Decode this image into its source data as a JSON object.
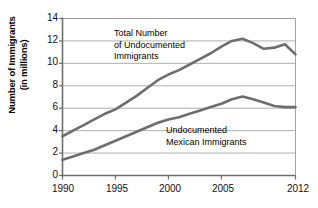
{
  "chart_data": {
    "type": "line",
    "title": "",
    "xlabel": "",
    "ylabel": "Number of Immigrants (in millions)",
    "ylabel_line1": "Number of Immigrants",
    "ylabel_line2": "(in millions)",
    "xlim": [
      1990,
      2012
    ],
    "ylim": [
      0,
      14
    ],
    "yticks": [
      "14",
      "12",
      "10",
      "8",
      "6",
      "4",
      "2",
      "0"
    ],
    "ytick_values": [
      14,
      12,
      10,
      8,
      6,
      4,
      2,
      0
    ],
    "xticks": [
      "1990",
      "1995",
      "2000",
      "2005",
      "2012"
    ],
    "xtick_values": [
      1990,
      1995,
      2000,
      2005,
      2012
    ],
    "grid": "horizontal",
    "legend": "annotations",
    "line_color": "#6e6e6e",
    "axis_color": "#808080",
    "grid_color": "#9a9a9a",
    "x": [
      1990,
      1991,
      1992,
      1993,
      1994,
      1995,
      1996,
      1997,
      1998,
      1999,
      2000,
      2001,
      2002,
      2003,
      2004,
      2005,
      2006,
      2007,
      2008,
      2009,
      2010,
      2011,
      2012
    ],
    "series": [
      {
        "name": "Total Number of Undocumented Immigrants",
        "annotation_lines": [
          "Total Number",
          "of Undocumented",
          "Immigrants"
        ],
        "values": [
          3.5,
          4.0,
          4.5,
          5.0,
          5.5,
          5.9,
          6.5,
          7.1,
          7.8,
          8.5,
          9.0,
          9.4,
          9.9,
          10.4,
          10.9,
          11.5,
          12.0,
          12.2,
          11.8,
          11.3,
          11.4,
          11.7,
          10.8
        ]
      },
      {
        "name": "Undocumented Mexican Immigrants",
        "annotation_lines": [
          "Undocumented",
          "Mexican Immigrants"
        ],
        "values": [
          1.4,
          1.7,
          2.0,
          2.3,
          2.7,
          3.1,
          3.5,
          3.9,
          4.3,
          4.7,
          5.0,
          5.2,
          5.5,
          5.8,
          6.1,
          6.4,
          6.8,
          7.05,
          6.8,
          6.5,
          6.2,
          6.1,
          6.1
        ]
      }
    ]
  }
}
